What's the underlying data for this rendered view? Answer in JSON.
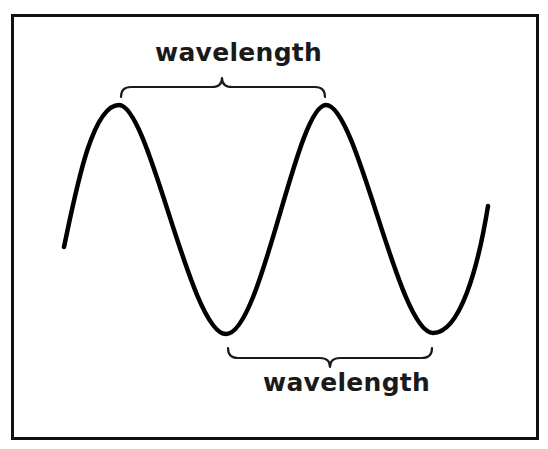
{
  "diagram": {
    "title": "",
    "type": "sine-wave-wavelength",
    "labels": {
      "top": "wavelength",
      "bottom": "wavelength"
    },
    "wave": {
      "start": [
        64,
        247
      ],
      "peaks": [
        [
          119,
          105
        ],
        [
          326,
          105
        ]
      ],
      "troughs": [
        [
          226,
          334
        ],
        [
          433,
          333
        ]
      ],
      "end": [
        488,
        206
      ],
      "stroke_color": "#000000"
    },
    "braces": {
      "top": {
        "from_x": 120,
        "to_x": 325,
        "y": 85,
        "points_to": "peak-to-peak"
      },
      "bottom": {
        "from_x": 227,
        "to_x": 432,
        "y": 355,
        "points_to": "trough-to-trough"
      }
    },
    "colors": {
      "background": "#ffffff",
      "border": "#111111",
      "ink": "#000000"
    }
  }
}
